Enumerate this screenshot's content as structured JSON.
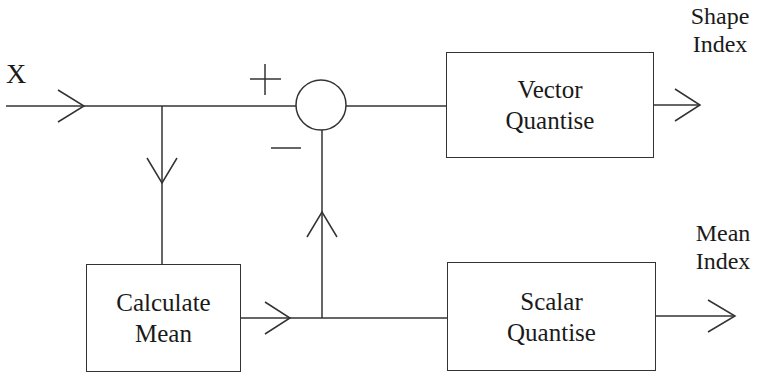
{
  "diagram": {
    "input_label": "X",
    "plus_sign": "+",
    "minus_sign": "−",
    "blocks": {
      "vector_quantise": {
        "line1": "Vector",
        "line2": "Quantise"
      },
      "calculate_mean": {
        "line1": "Calculate",
        "line2": "Mean"
      },
      "scalar_quantise": {
        "line1": "Scalar",
        "line2": "Quantise"
      }
    },
    "outputs": {
      "shape_index": {
        "line1": "Shape",
        "line2": "Index"
      },
      "mean_index": {
        "line1": "Mean",
        "line2": "Index"
      }
    },
    "summing_junction": "subtractor"
  }
}
